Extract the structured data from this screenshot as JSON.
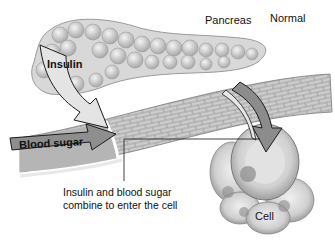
{
  "labels": {
    "pancreas": "Pancreas",
    "normal": "Normal",
    "insulin": "Insulin",
    "blood_sugar": "Blood sugar",
    "caption_line1": "Insulin and blood sugar",
    "caption_line2": "combine to enter the cell",
    "cell": "Cell"
  },
  "colors": {
    "background": "#ffffff",
    "pancreas_fill": "#d9d9d9",
    "pancreas_stroke": "#9a9a9a",
    "vessel_fill": "#c8c8c8",
    "vessel_brick": "#8f8f8f",
    "insulin_arrow": "#e6e6e6",
    "blood_sugar_arrow": "#8c8c8c",
    "cell_fill": "#d4d4d4",
    "outline": "#222222"
  }
}
